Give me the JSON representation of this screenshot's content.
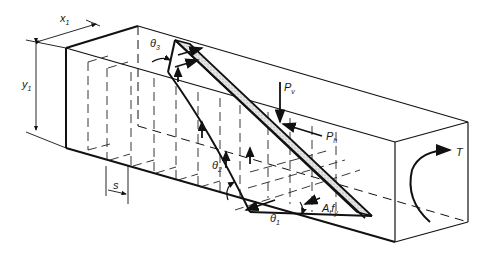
{
  "figure": {
    "type": "space-truss model of beam in torsion and shear",
    "labels": {
      "x1": {
        "main": "x",
        "sub": "1"
      },
      "y1": {
        "main": "y",
        "sub": "1"
      },
      "theta3": {
        "main": "θ",
        "sub": "3"
      },
      "theta2": {
        "main": "θ",
        "sub": "2"
      },
      "theta1": {
        "main": "θ",
        "sub": "1"
      },
      "pv": {
        "main": "P",
        "sub": "v"
      },
      "ph": {
        "main": "P",
        "sub": "h"
      },
      "atfy": {
        "main": "A",
        "sub1": "t",
        "mid": "f",
        "sub2": "y"
      },
      "s": "s",
      "torque": "T"
    },
    "colors": {
      "line": "#111111",
      "strut_fill": "#d8d8d8"
    }
  }
}
